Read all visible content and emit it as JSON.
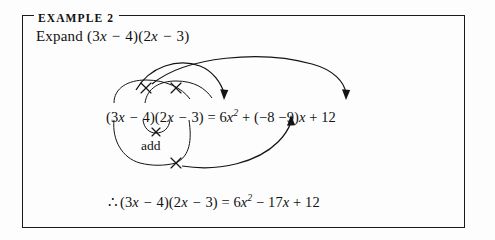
{
  "page": {
    "background_color": "#fdfdfd",
    "ink_color": "#141414"
  },
  "example_box": {
    "title": "EXAMPLE 2",
    "border_color": "#1a1a1a"
  },
  "instruction": {
    "prefix": "Expand ",
    "expression": {
      "open1": "(3",
      "var1": "x",
      "op1": " − ",
      "num1": "4)(2",
      "var2": "x",
      "op2": " − ",
      "num2": "3)"
    },
    "full_text": "Expand (3x − 4)(2x − 3)"
  },
  "working": {
    "left_open": "(3",
    "left_var": "x",
    "left_op": " − ",
    "left_num": "4)(2",
    "right_var": "x",
    "right_op": " − ",
    "right_num": "3)",
    "equals": " = 6",
    "sq_var": "x",
    "sq_exp": "2",
    "middle": " + (−8 −9)",
    "mid_var": "x",
    "tail": " + 12",
    "full_text": "(3x − 4)(2x − 3) = 6x² + (−8 −9)x + 12"
  },
  "add_label": {
    "text": "add"
  },
  "answer": {
    "therefore": "∴",
    "left_open": "(3",
    "left_var": "x",
    "left_op": " − ",
    "left_num": "4)(2",
    "right_var": "x",
    "right_op": " − ",
    "right_num": "3)",
    "equals": " = 6",
    "sq_var": "x",
    "sq_exp": "2",
    "middle": " − 17",
    "mid_var": "x",
    "tail": " + 12",
    "full_text": "∴ (3x − 4)(2x − 3) = 6x² − 17x + 12"
  },
  "annotations": {
    "cross_marks": [
      {
        "name": "outer-left-cross",
        "x": 146,
        "y": 88
      },
      {
        "name": "inner-cross",
        "x": 176,
        "y": 88
      },
      {
        "name": "inner-lower-cross",
        "x": 156,
        "y": 131
      },
      {
        "name": "outer-lower-cross",
        "x": 176,
        "y": 163
      }
    ],
    "arrow_targets": [
      {
        "name": "arrow-to-x-squared",
        "x": 224,
        "y": 99
      },
      {
        "name": "arrow-to-constant",
        "x": 346,
        "y": 99
      },
      {
        "name": "arrow-to-middle-term",
        "x": 291,
        "y": 122
      }
    ]
  }
}
